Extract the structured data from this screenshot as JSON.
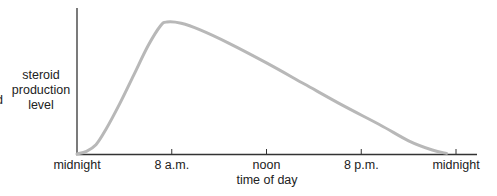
{
  "chart_data": {
    "type": "line",
    "title": "",
    "xlabel": "time of day",
    "ylabel_lines": [
      "steroid",
      "production",
      "level"
    ],
    "cropped_left_fragment": "d",
    "x_ticks": [
      "midnight",
      "8 a.m.",
      "noon",
      "8 p.m.",
      "midnight"
    ],
    "x_range_tick_index": [
      0,
      4
    ],
    "ylim": [
      0,
      1
    ],
    "y_ticks": [],
    "grid": false,
    "legend": "none",
    "series": [
      {
        "name": "steroid production level",
        "color": "#b8b8b8",
        "points": [
          {
            "x": 0.0,
            "y": 0.0
          },
          {
            "x": 0.1,
            "y": 0.02
          },
          {
            "x": 0.2,
            "y": 0.07
          },
          {
            "x": 0.3,
            "y": 0.18
          },
          {
            "x": 0.45,
            "y": 0.38
          },
          {
            "x": 0.6,
            "y": 0.6
          },
          {
            "x": 0.75,
            "y": 0.82
          },
          {
            "x": 0.88,
            "y": 0.97
          },
          {
            "x": 0.95,
            "y": 1.0
          },
          {
            "x": 1.1,
            "y": 0.99
          },
          {
            "x": 1.3,
            "y": 0.94
          },
          {
            "x": 1.6,
            "y": 0.84
          },
          {
            "x": 2.0,
            "y": 0.69
          },
          {
            "x": 2.4,
            "y": 0.53
          },
          {
            "x": 2.8,
            "y": 0.37
          },
          {
            "x": 3.2,
            "y": 0.22
          },
          {
            "x": 3.5,
            "y": 0.1
          },
          {
            "x": 3.75,
            "y": 0.03
          },
          {
            "x": 3.9,
            "y": 0.005
          }
        ]
      }
    ]
  }
}
